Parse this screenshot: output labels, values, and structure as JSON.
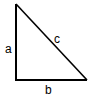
{
  "diagram": {
    "type": "right-triangle",
    "stroke_color": "#000000",
    "background": "#ffffff",
    "vertices": {
      "top": [
        16,
        4
      ],
      "bottom_left": [
        16,
        80
      ],
      "bottom_right": [
        87,
        80
      ]
    },
    "labels": {
      "a": "a",
      "b": "b",
      "c": "c"
    }
  }
}
